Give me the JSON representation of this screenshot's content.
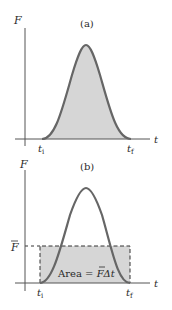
{
  "panels": [
    {
      "id": "a",
      "title": "(a)",
      "y_axis_label": "F",
      "x_axis_label": "t",
      "t_initial_label": "t",
      "t_initial_sub": "i",
      "t_final_label": "t",
      "t_final_sub": "f"
    },
    {
      "id": "b",
      "title": "(b)",
      "y_axis_label": "F",
      "x_axis_label": "t",
      "avg_force_label": "F",
      "t_initial_label": "t",
      "t_initial_sub": "i",
      "t_final_label": "t",
      "t_final_sub": "f",
      "area_label_prefix": "Area = ",
      "area_label_F": "F",
      "area_label_suffix": "Δt"
    }
  ],
  "colors": {
    "curve": "#666666",
    "fill": "#d6d6d6",
    "axis": "#555555",
    "text": "#2a2a2a"
  }
}
